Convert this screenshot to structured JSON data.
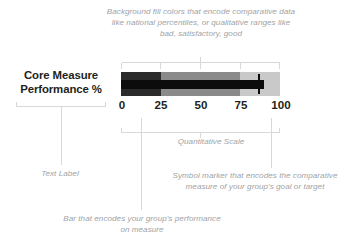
{
  "row": {
    "label_line1": "Core Measure",
    "label_line2": "Performance %"
  },
  "annotations": {
    "bands": "Background fill colors that encode comparative data like national percentiles, or qualitative ranges like bad, satisfactory, good",
    "scale": "Quantitative Scale",
    "text_label": "Text Label",
    "marker": "Symbol marker that encodes the comparative measure of your group's goal or target",
    "bar": "Bar that encodes your group's performance on measure"
  },
  "axis": {
    "labels": [
      "0",
      "25",
      "50",
      "75",
      "100"
    ],
    "min": 0,
    "max": 100
  },
  "colors": {
    "band_bad": "#2b2b2b",
    "band_satisfactory": "#8a8a8a",
    "band_good": "#c9c9c9",
    "bar": "#0c0c0c",
    "marker": "#0c0c0c",
    "label_text": "#231f20",
    "annotation_text": "#a0a3a6",
    "line_art": "#d6d8da"
  },
  "chart_data": {
    "type": "bar",
    "title": "",
    "xlabel": "Quantitative Scale",
    "ylabel": "",
    "categories": [
      "Core Measure Performance %"
    ],
    "values": [
      90
    ],
    "target": 87,
    "xlim": [
      0,
      100
    ],
    "ticks": [
      0,
      25,
      50,
      75,
      100
    ],
    "grid": false,
    "legend": "none",
    "bands": [
      {
        "name": "bad",
        "from": 0,
        "to": 25,
        "color": "#2b2b2b"
      },
      {
        "name": "satisfactory",
        "from": 25,
        "to": 75,
        "color": "#8a8a8a"
      },
      {
        "name": "good",
        "from": 75,
        "to": 100,
        "color": "#c9c9c9"
      }
    ],
    "series": [
      {
        "name": "performance",
        "values": [
          90
        ]
      },
      {
        "name": "goal_target",
        "values": [
          87
        ]
      }
    ]
  }
}
